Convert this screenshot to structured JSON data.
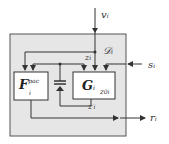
{
  "diagram": {
    "colors": {
      "background": "#ffffff",
      "outer_box_fill": "#e6e6e6",
      "outer_box_stroke": "#555555",
      "inner_box_fill": "#ffffff",
      "line": "#333333"
    },
    "inputs": {
      "v": "v",
      "v_sub": "i",
      "s": "s",
      "s_sub": "i"
    },
    "outputs": {
      "r": "r",
      "r_sub": "i"
    },
    "labels": {
      "D": "𝒟",
      "D_sub": "i",
      "z": "z",
      "z_sub": "i",
      "z_prime": "z",
      "z_prime_sup": "′",
      "z_prime_sub": "i"
    },
    "blocks": {
      "F": {
        "name": "F",
        "sup": "pac",
        "sub": "i"
      },
      "G": {
        "name": "G",
        "sub": "i",
        "port": "z",
        "port_sub": "0i"
      }
    },
    "elements": {
      "storage": "capacitor-diode symbol"
    }
  }
}
